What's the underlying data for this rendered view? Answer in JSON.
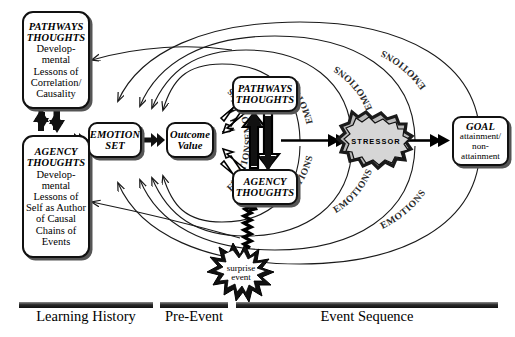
{
  "diagram": {
    "boxes": {
      "pathways_history": {
        "header": "PATHWAYS\nTHOUGHTS",
        "body": "Develop-\nmental\nLessons of\nCorrelation/\nCausality"
      },
      "agency_history": {
        "header": "AGENCY\nTHOUGHTS",
        "body": "Develop-\nmental\nLessons of\nSelf as Author\nof Causal\nChains of\nEvents"
      },
      "emotion_set": {
        "header": "EMOTION\nSET"
      },
      "outcome_value": {
        "header": "Outcome\nValue"
      },
      "pathways_event": {
        "header": "PATHWAYS\nTHOUGHTS"
      },
      "agency_event": {
        "header": "AGENCY\nTHOUGHTS"
      },
      "stressor": {
        "label": "STRESSOR"
      },
      "surprise": {
        "line1": "surprise",
        "line2": "event"
      },
      "goal": {
        "header": "GOAL",
        "body": "attainment/\nnon-\nattainment"
      }
    },
    "phases": [
      {
        "label": "Learning History"
      },
      {
        "label": "Pre-Event"
      },
      {
        "label": "Event Sequence"
      }
    ],
    "feedback_labels": [
      {
        "text": "EMOTIONS"
      },
      {
        "text": "EMOTIONS"
      },
      {
        "text": "EMOTIONS"
      },
      {
        "text": "EMOTIONS"
      },
      {
        "text": "EMOTIONS"
      },
      {
        "text": "EMOTIONS"
      },
      {
        "text": "EMOTIONS"
      },
      {
        "text": "EMOTIONS"
      }
    ],
    "colors": {
      "ink": "#000000",
      "shadow": "#555555",
      "stressor_fill": "#c9c9c9",
      "stressor_edge": "#1a1a1a",
      "bar": "#1a1a1a",
      "background": "#ffffff"
    }
  }
}
